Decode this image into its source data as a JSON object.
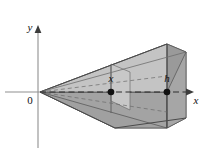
{
  "figure": {
    "background_color": "#ffffff",
    "axes": {
      "origin_label": "0",
      "x_axis_label": "x",
      "y_axis_label": "y",
      "axis_color": "#8c8c8c",
      "origin_px": {
        "x": 38,
        "y": 92
      },
      "x_axis_from_px": {
        "x": 5,
        "y": 92
      },
      "x_axis_to_px": {
        "x": 186,
        "y": 92
      },
      "y_axis_from_px": {
        "x": 38,
        "y": 148
      },
      "y_axis_to_px": {
        "x": 38,
        "y": 27
      }
    },
    "markers": [
      {
        "name": "cross-section-point",
        "label": "x",
        "px": {
          "x": 111,
          "y": 92
        },
        "label_px": {
          "x": 111,
          "y": 81
        },
        "radius": 3.2
      },
      {
        "name": "height-point",
        "label": "h",
        "px": {
          "x": 167,
          "y": 92
        },
        "label_px": {
          "x": 167,
          "y": 81
        },
        "radius": 3.2
      }
    ],
    "colors": {
      "front_face": "#a8a8a8",
      "top_face": "#c2c2c2",
      "side_face": "#989898",
      "cross_section": "#b8b8b8",
      "lower_wedge": "#a0a0a0",
      "outline": "#555555",
      "dashed": "#3a3a3a"
    },
    "solid": {
      "name": "wedge-solid",
      "apex_px": {
        "x": 40,
        "y": 92
      },
      "cross_section_plane_x_px": 111,
      "end_face_x_px": 167
    }
  }
}
